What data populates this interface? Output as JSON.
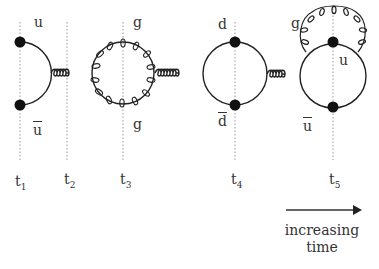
{
  "diagram": {
    "type": "feynman-diagram",
    "colors": {
      "line": "#222222",
      "guide": "#9a9a9a",
      "vertex": "#111111"
    },
    "particles": {
      "u_top": "u",
      "u_bar_left": "u",
      "g_top": "g",
      "g_bottom": "g",
      "d_top": "d",
      "d_bar": "d",
      "g_self": "g",
      "u_right": "u",
      "u_bar_right": "u"
    },
    "time_slices": [
      {
        "t": "t",
        "sub": "1"
      },
      {
        "t": "t",
        "sub": "2"
      },
      {
        "t": "t",
        "sub": "3"
      },
      {
        "t": "t",
        "sub": "4"
      },
      {
        "t": "t",
        "sub": "5"
      }
    ],
    "caption": {
      "line1": "increasing",
      "line2": "time"
    }
  }
}
